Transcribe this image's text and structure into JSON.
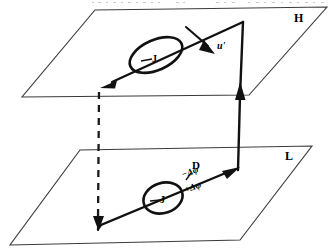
{
  "figure": {
    "background_color": "#ffffff",
    "line_color": "#111111",
    "plane_edge_color": "#3a3a3a",
    "width": 332,
    "height": 250
  },
  "planes": [
    {
      "id": "upper-plane",
      "label": "H",
      "label_position": {
        "x": 296,
        "y": 18
      },
      "corners": [
        {
          "x": 95,
          "y": 10
        },
        {
          "x": 327,
          "y": 7
        },
        {
          "x": 249,
          "y": 95
        },
        {
          "x": 22,
          "y": 97
        }
      ]
    },
    {
      "id": "lower-plane",
      "label": "L",
      "label_position": {
        "x": 287,
        "y": 156
      },
      "corners": [
        {
          "x": 80,
          "y": 150
        },
        {
          "x": 312,
          "y": 146
        },
        {
          "x": 240,
          "y": 240
        },
        {
          "x": 10,
          "y": 245
        }
      ]
    }
  ],
  "annotations": {
    "upper_vortex_label": "J",
    "lower_vortex_label": "J",
    "velocity_label": "u'",
    "spacing_label": "D",
    "phase_negative_label": "−Δφ",
    "phase_positive_label": "+Δφ"
  },
  "elements": {
    "upper_flux_line": {
      "name": "upper-flux-line",
      "from": {
        "x": 243,
        "y": 22
      },
      "to": {
        "x": 100,
        "y": 88
      },
      "arrow_at": "to"
    },
    "lower_flux_line": {
      "name": "lower-flux-line",
      "from": {
        "x": 98,
        "y": 228
      },
      "to": {
        "x": 238,
        "y": 168
      },
      "arrow_at": "to"
    },
    "vertical_connector": {
      "name": "vertical-connector",
      "from": {
        "x": 238,
        "y": 168
      },
      "to": {
        "x": 243,
        "y": 22
      },
      "arrow_at": "mid-up"
    },
    "dashed_connector": {
      "name": "dashed-connector",
      "from": {
        "x": 99,
        "y": 90
      },
      "to": {
        "x": 98,
        "y": 228
      },
      "arrow_at": "to"
    },
    "velocity_arrow": {
      "name": "velocity-arrow",
      "from": {
        "x": 186,
        "y": 27
      },
      "to": {
        "x": 214,
        "y": 52
      }
    }
  },
  "vortices": [
    {
      "name": "upper-vortex-loop",
      "cx": 156,
      "cy": 55,
      "rx": 28,
      "ry": 15,
      "rotation": -24
    },
    {
      "name": "lower-vortex-loop",
      "cx": 163,
      "cy": 198,
      "rx": 20,
      "ry": 15,
      "rotation": -18
    }
  ]
}
